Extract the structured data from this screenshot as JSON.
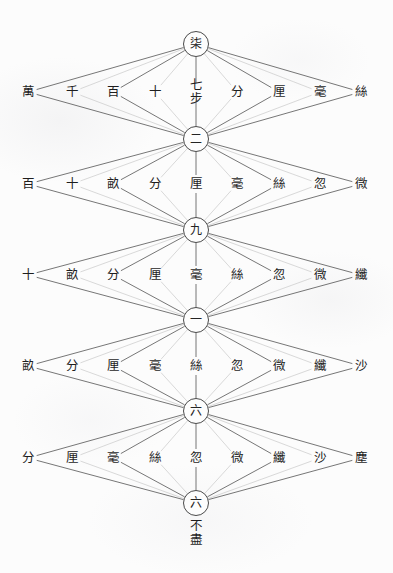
{
  "diagram": {
    "title": "",
    "type": "chinese-unit-conversion-lattice",
    "background_color": "#fcfcfc",
    "line_color_dark": "#4a4a4a",
    "line_color_light": "#c8c8c8",
    "text_color": "#1e1e1e",
    "nodes": [
      {
        "id": "n0",
        "label": "柒",
        "x": 196,
        "y": 44
      },
      {
        "id": "n1",
        "label": "二",
        "x": 196,
        "y": 139
      },
      {
        "id": "n2",
        "label": "九",
        "x": 196,
        "y": 230
      },
      {
        "id": "n3",
        "label": "一",
        "x": 196,
        "y": 320
      },
      {
        "id": "n4",
        "label": "六",
        "x": 196,
        "y": 411
      },
      {
        "id": "n5",
        "label": "六",
        "x": 196,
        "y": 503
      }
    ],
    "node_tail": {
      "attached_to": "n5",
      "lines": [
        "不",
        "盡"
      ],
      "x": 196,
      "y": 519
    },
    "rows": [
      {
        "row": 1,
        "y": 92,
        "labels": [
          {
            "text": "萬",
            "x": 28
          },
          {
            "text": "千",
            "x": 72
          },
          {
            "text": "百",
            "x": 113
          },
          {
            "text": "十",
            "x": 155
          },
          {
            "text": "七\n步",
            "x": 196,
            "stacked": true
          },
          {
            "text": "分",
            "x": 237
          },
          {
            "text": "厘",
            "x": 279
          },
          {
            "text": "毫",
            "x": 320
          },
          {
            "text": "絲",
            "x": 361
          }
        ]
      },
      {
        "row": 2,
        "y": 184,
        "labels": [
          {
            "text": "百",
            "x": 28
          },
          {
            "text": "十",
            "x": 72
          },
          {
            "text": "畝",
            "x": 113
          },
          {
            "text": "分",
            "x": 155
          },
          {
            "text": "厘",
            "x": 196
          },
          {
            "text": "毫",
            "x": 237
          },
          {
            "text": "絲",
            "x": 279
          },
          {
            "text": "忽",
            "x": 320
          },
          {
            "text": "微",
            "x": 361
          }
        ]
      },
      {
        "row": 3,
        "y": 275,
        "labels": [
          {
            "text": "十",
            "x": 28
          },
          {
            "text": "畝",
            "x": 72
          },
          {
            "text": "分",
            "x": 113
          },
          {
            "text": "厘",
            "x": 155
          },
          {
            "text": "毫",
            "x": 196
          },
          {
            "text": "絲",
            "x": 237
          },
          {
            "text": "忽",
            "x": 279
          },
          {
            "text": "微",
            "x": 320
          },
          {
            "text": "纖",
            "x": 361
          }
        ]
      },
      {
        "row": 4,
        "y": 366,
        "labels": [
          {
            "text": "畝",
            "x": 28
          },
          {
            "text": "分",
            "x": 72
          },
          {
            "text": "厘",
            "x": 113
          },
          {
            "text": "毫",
            "x": 155
          },
          {
            "text": "絲",
            "x": 196
          },
          {
            "text": "忽",
            "x": 237
          },
          {
            "text": "微",
            "x": 279
          },
          {
            "text": "纖",
            "x": 320
          },
          {
            "text": "沙",
            "x": 361
          }
        ]
      },
      {
        "row": 5,
        "y": 458,
        "labels": [
          {
            "text": "分",
            "x": 28
          },
          {
            "text": "厘",
            "x": 72
          },
          {
            "text": "毫",
            "x": 113
          },
          {
            "text": "絲",
            "x": 155
          },
          {
            "text": "忽",
            "x": 196
          },
          {
            "text": "微",
            "x": 237
          },
          {
            "text": "纖",
            "x": 279
          },
          {
            "text": "沙",
            "x": 320
          },
          {
            "text": "塵",
            "x": 361
          }
        ]
      }
    ]
  }
}
